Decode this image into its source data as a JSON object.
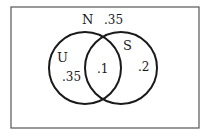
{
  "diagram": {
    "type": "venn",
    "universe": {
      "label": "N",
      "outside_value": ".35"
    },
    "sets": [
      {
        "label": "U",
        "only_value": ".35"
      },
      {
        "label": "S",
        "only_value": ".2"
      }
    ],
    "intersection_value": ".1",
    "colors": {
      "stroke": "#1a1a1a",
      "background": "#ffffff"
    }
  }
}
